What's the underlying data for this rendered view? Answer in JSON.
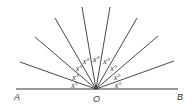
{
  "diagram": {
    "points": {
      "A": "A",
      "O": "O",
      "B": "B"
    },
    "angle_label": "x°",
    "angle_count": 9,
    "vertex": [
      96,
      89
    ],
    "baseline": {
      "x1": 16,
      "x2": 178,
      "y": 89
    },
    "rays": [
      [
        20,
        62
      ],
      [
        35,
        37
      ],
      [
        55,
        18
      ],
      [
        82,
        7
      ],
      [
        110,
        7
      ],
      [
        137,
        18
      ],
      [
        158,
        36
      ],
      [
        174,
        61
      ]
    ],
    "angle_labels": [
      "x°",
      "x°",
      "x°",
      "x°",
      "x°",
      "x°",
      "x°",
      "x°",
      "x°"
    ],
    "line_color": "#333333"
  }
}
